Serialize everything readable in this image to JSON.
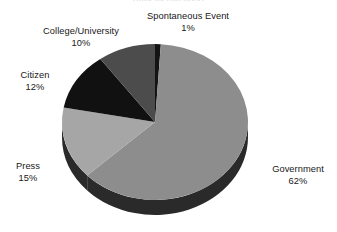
{
  "chart_data": {
    "type": "pie",
    "title": "",
    "subtitle": "(tally by category)",
    "xlabel": "",
    "ylabel": "",
    "legend_position": "none",
    "grid": false,
    "three_d": true,
    "labels_show_percent": true,
    "categories": [
      "Spontaneous Event",
      "Government",
      "Press",
      "Citizen",
      "College/University"
    ],
    "values": [
      1,
      62,
      15,
      12,
      10
    ],
    "slices": [
      {
        "label": "Spontaneous Event",
        "value": 1,
        "percent_text": "1%",
        "color": "#141414",
        "side_color": "#0a0a0a",
        "start_angle": 0,
        "end_angle": 3.6
      },
      {
        "label": "Government",
        "value": 62,
        "percent_text": "62%",
        "color": "#8d8d8d",
        "side_color": "#2a2a2a",
        "start_angle": 3.6,
        "end_angle": 226.8
      },
      {
        "label": "Press",
        "value": 15,
        "percent_text": "15%",
        "color": "#a6a6a6",
        "side_color": "#2a2a2a",
        "start_angle": 226.8,
        "end_angle": 280.8
      },
      {
        "label": "Citizen",
        "value": 12,
        "percent_text": "12%",
        "color": "#111111",
        "side_color": "#0a0a0a",
        "start_angle": 280.8,
        "end_angle": 324.0
      },
      {
        "label": "College/University",
        "value": 10,
        "percent_text": "10%",
        "color": "#4c4c4c",
        "side_color": "#141414",
        "start_angle": 324.0,
        "end_angle": 360.0
      }
    ],
    "annotations": [
      {
        "name": "Spontaneous Event",
        "percent": "1%"
      },
      {
        "name": "College/University",
        "percent": "10%"
      },
      {
        "name": "Citizen",
        "percent": "12%"
      },
      {
        "name": "Press",
        "percent": "15%"
      },
      {
        "name": "Government",
        "percent": "62%"
      }
    ]
  },
  "labels": {
    "spontaneous": {
      "name": "Spontaneous Event",
      "value": "1%"
    },
    "college": {
      "name": "College/University",
      "value": "10%"
    },
    "citizen": {
      "name": "Citizen",
      "value": "12%"
    },
    "press": {
      "name": "Press",
      "value": "15%"
    },
    "government": {
      "name": "Government",
      "value": "62%"
    }
  },
  "colors": {
    "background": "#ffffff",
    "text": "#181818",
    "government": "#8d8d8d",
    "press": "#a6a6a6",
    "citizen": "#111111",
    "college": "#4c4c4c",
    "spontaneous": "#141414",
    "pie_side": "#2a2a2a"
  },
  "geometry": {
    "cx": 155,
    "cy": 122,
    "rx": 93,
    "ry": 78,
    "depth": 15
  }
}
